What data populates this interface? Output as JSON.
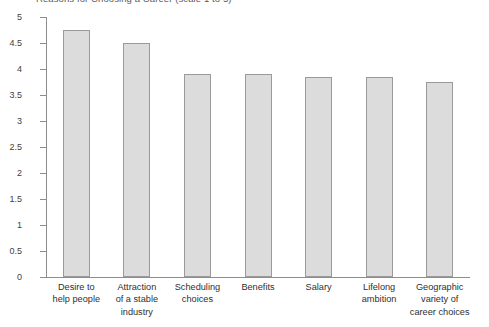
{
  "chart_data": {
    "type": "bar",
    "title": "Reasons for Choosing a Career (scale 1 to 5)",
    "xlabel": "",
    "ylabel": "",
    "ylim": [
      0,
      5
    ],
    "ytick_labels": [
      "5",
      "4.5",
      "4",
      "3.5",
      "3",
      "2.5",
      "2",
      "1.5",
      "1",
      "0.5",
      "0"
    ],
    "ytick_values": [
      5,
      4.5,
      4,
      3.5,
      3,
      2.5,
      2,
      1.5,
      1,
      0.5,
      0
    ],
    "grid": false,
    "legend": "none",
    "categories": [
      "Desire to\nhelp people",
      "Attraction\nof a stable\nindustry",
      "Scheduling\nchoices",
      "Benefits",
      "Salary",
      "Lifelong\nambition",
      "Geographic\nvariety of\ncareer choices"
    ],
    "category_lines": [
      [
        "Desire to",
        "help people"
      ],
      [
        "Attraction",
        "of a stable",
        "industry"
      ],
      [
        "Scheduling",
        "choices"
      ],
      [
        "Benefits"
      ],
      [
        "Salary"
      ],
      [
        "Lifelong",
        "ambition"
      ],
      [
        "Geographic",
        "variety of",
        "career choices"
      ]
    ],
    "values": [
      4.75,
      4.5,
      3.9,
      3.9,
      3.85,
      3.85,
      3.75
    ],
    "bar_fill_color": "#dcdcdc",
    "bar_border_color": "#9a9a9a",
    "axis_color": "#8d8d8d"
  }
}
